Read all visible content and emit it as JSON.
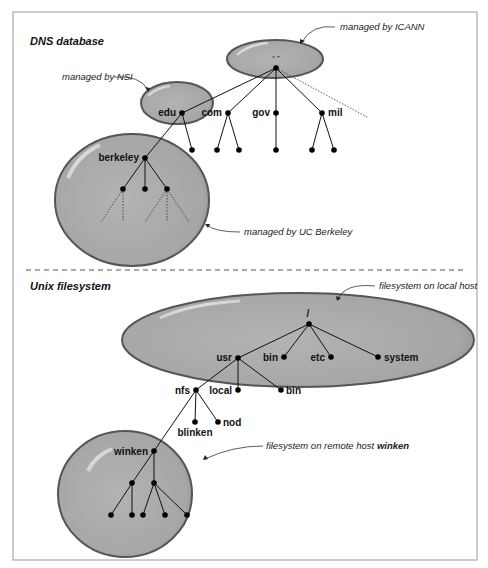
{
  "frame": {
    "x": 13,
    "y": 12,
    "width": 464,
    "height": 548,
    "border_color": "#9a9a9a"
  },
  "colors": {
    "blob_fill": "#a9a9a9",
    "blob_stroke": "#5a5a5a",
    "line": "#111111",
    "background": "#ffffff"
  },
  "dns": {
    "title": "DNS database",
    "root_label": "“ ”",
    "annotations": {
      "icann": "managed by ICANN",
      "nsi": "managed by NSI",
      "ucb": "managed by UC Berkeley"
    },
    "tld_labels": {
      "edu": "edu",
      "com": "com",
      "gov": "gov",
      "mil": "mil"
    },
    "berkeley_label": "berkeley"
  },
  "unix": {
    "title": "Unix filesystem",
    "root_label": "/",
    "annotations": {
      "local": "filesystem on local host",
      "remote_prefix": "filesystem on remote host ",
      "remote_host": "winken"
    },
    "labels": {
      "usr": "usr",
      "bin_top": "bin",
      "etc": "etc",
      "system": "system",
      "nfs": "nfs",
      "local": "local",
      "bin_usr": "bin",
      "blinken": "blinken",
      "nod": "nod",
      "winken": "winken"
    }
  }
}
